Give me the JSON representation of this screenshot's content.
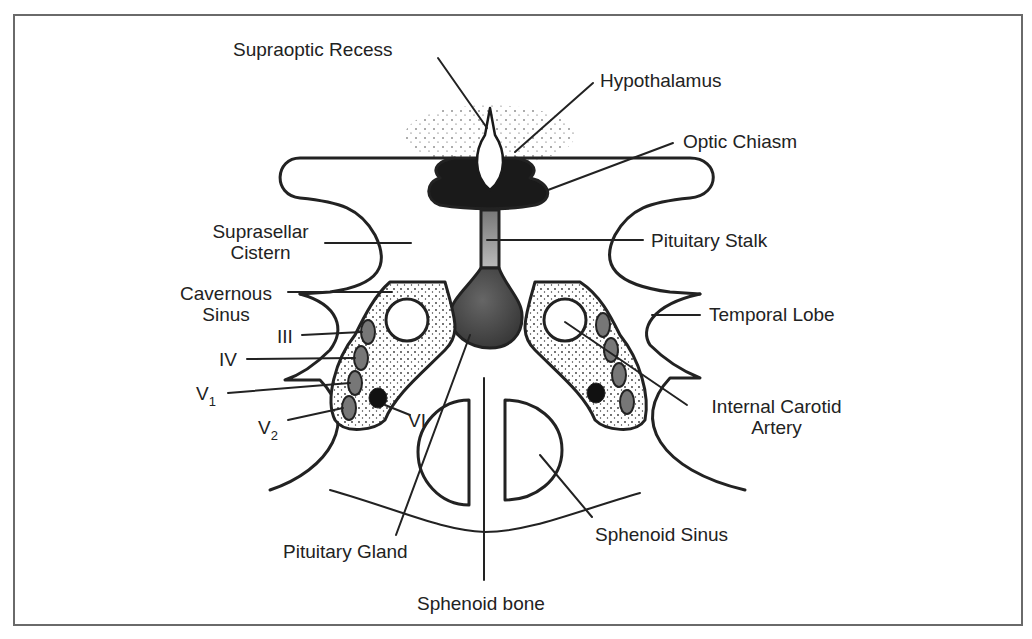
{
  "figure": {
    "type": "anatomical cross-section",
    "colors": {
      "ink": "#222222",
      "frame": "#6a6a6a",
      "gland_gray": "#555555",
      "nerve_gray": "#777777",
      "background": "#ffffff"
    }
  },
  "labels": {
    "supraoptic_recess": "Supraoptic Recess",
    "hypothalamus": "Hypothalamus",
    "optic_chiasm": "Optic Chiasm",
    "suprasellar_cistern_1": "Suprasellar",
    "suprasellar_cistern_2": "Cistern",
    "pituitary_stalk": "Pituitary Stalk",
    "cavernous_sinus_1": "Cavernous",
    "cavernous_sinus_2": "Sinus",
    "temporal_lobe": "Temporal Lobe",
    "cn_iii": "III",
    "cn_iv": "IV",
    "cn_v1_main": "V",
    "cn_v1_sub": "1",
    "cn_v2_main": "V",
    "cn_v2_sub": "2",
    "cn_vi": "VI",
    "internal_carotid_1": "Internal Carotid",
    "internal_carotid_2": "Artery",
    "pituitary_gland": "Pituitary Gland",
    "sphenoid_sinus": "Sphenoid Sinus",
    "sphenoid_bone": "Sphenoid bone"
  }
}
